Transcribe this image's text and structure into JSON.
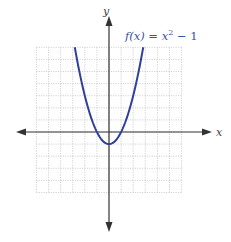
{
  "chart_data": {
    "type": "line",
    "title": "",
    "function_label": "f(x) = x² − 1",
    "function_label_parts": {
      "prefix": "f(x) = x",
      "sup": "2",
      "suffix": " − 1"
    },
    "xlabel": "x",
    "ylabel": "y",
    "xlim": [
      -6,
      6
    ],
    "ylim": [
      -5,
      7
    ],
    "grid": true,
    "grid_step": 1,
    "axis_ticks_labeled": false,
    "series": [
      {
        "name": "f(x) = x² − 1",
        "color": "#2f3f9a",
        "x": [
          -2.83,
          -2.5,
          -2,
          -1.5,
          -1,
          -0.5,
          0,
          0.5,
          1,
          1.5,
          2,
          2.5,
          2.83
        ],
        "y": [
          7,
          5.25,
          3,
          1.25,
          0,
          -0.75,
          -1,
          -0.75,
          0,
          1.25,
          3,
          5.25,
          7
        ]
      }
    ],
    "vertex": [
      0,
      -1
    ]
  },
  "colors": {
    "curve": "#2f3f9a",
    "grid": "#c8c8c8",
    "axis": "#333333",
    "label": "#3a4ea0"
  }
}
